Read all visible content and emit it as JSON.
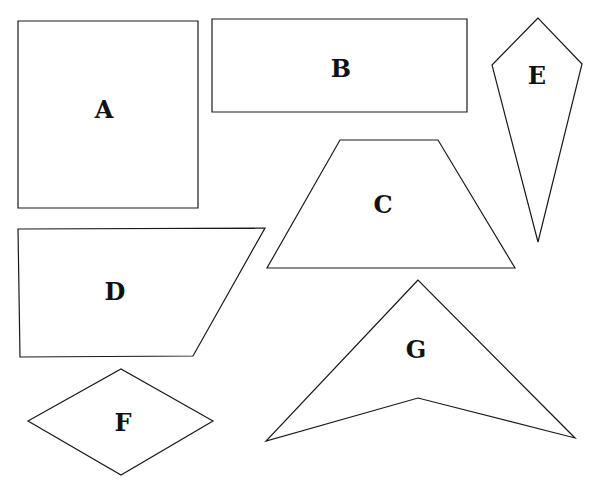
{
  "diagram": {
    "type": "geometric-shapes",
    "shapes": [
      {
        "label": "A",
        "kind": "square",
        "points": "18,21 198,21 198,208 18,208",
        "label_pos": [
          104,
          111
        ]
      },
      {
        "label": "B",
        "kind": "rectangle",
        "points": "212,19 467,19 467,112 212,112",
        "label_pos": [
          341,
          70
        ]
      },
      {
        "label": "C",
        "kind": "trapezoid",
        "points": "340,140 438,140 515,268 267,268",
        "label_pos": [
          383,
          206
        ]
      },
      {
        "label": "D",
        "kind": "right-trapezoid",
        "points": "18,229 265,228 193,356 20,357",
        "label_pos": [
          115,
          293
        ]
      },
      {
        "label": "E",
        "kind": "kite",
        "points": "538,18 492,65 538,242 582,64",
        "label_pos": [
          537,
          77
        ]
      },
      {
        "label": "F",
        "kind": "rhombus",
        "points": "28,421 121,369 213,421 121,475",
        "label_pos": [
          123,
          424
        ]
      },
      {
        "label": "G",
        "kind": "concave-quadrilateral",
        "points": "418,280 266,441 418,398 575,438",
        "label_pos": [
          416,
          351
        ]
      }
    ],
    "colors": {
      "stroke": "#1a1a1a",
      "fill": "#ffffff",
      "background": "#ffffff"
    }
  }
}
